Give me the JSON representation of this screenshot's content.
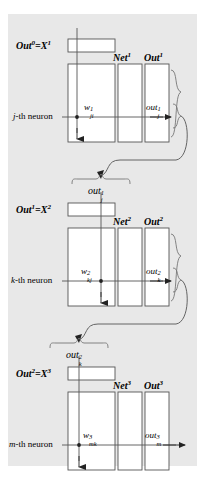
{
  "figure": {
    "background_color": "#e8e8e8",
    "line_color": "#555555",
    "text_color": "#000000"
  },
  "blocks": [
    {
      "id": "layer-1",
      "input_row_label": {
        "base": "Out",
        "sup1": "0",
        "eq": "=",
        "base2": "X",
        "sup2": "1"
      },
      "neuron_label": {
        "index": "j",
        "text": "-th neuron"
      },
      "column_headers": [
        {
          "base": "Net",
          "sup": "1"
        },
        {
          "base": "Out",
          "sup": "1"
        }
      ],
      "weight_symbol": {
        "base": "w",
        "sup": "1",
        "sub": "ji"
      },
      "output_symbol": {
        "base": "out",
        "sup": "1",
        "sub": "j"
      },
      "feedback_label": {
        "base": "out",
        "sup": "1",
        "sub": "j"
      },
      "has_feedback_loop": true
    },
    {
      "id": "layer-2",
      "input_row_label": {
        "base": "Out",
        "sup1": "1",
        "eq": "=",
        "base2": "X",
        "sup2": "2"
      },
      "neuron_label": {
        "index": "k",
        "text": "-th neuron"
      },
      "column_headers": [
        {
          "base": "Net",
          "sup": "2"
        },
        {
          "base": "Out",
          "sup": "2"
        }
      ],
      "weight_symbol": {
        "base": "w",
        "sup": "2",
        "sub": "kj"
      },
      "output_symbol": {
        "base": "out",
        "sup": "2",
        "sub": "k"
      },
      "feedback_label": {
        "base": "out",
        "sup": "2",
        "sub": "k"
      },
      "has_feedback_loop": true
    },
    {
      "id": "layer-3",
      "input_row_label": {
        "base": "Out",
        "sup1": "2",
        "eq": "=",
        "base2": "X",
        "sup2": "3"
      },
      "neuron_label": {
        "index": "m",
        "text": "-th neuron"
      },
      "column_headers": [
        {
          "base": "Net",
          "sup": "3"
        },
        {
          "base": "Out",
          "sup": "3"
        }
      ],
      "weight_symbol": {
        "base": "w",
        "sup": "3",
        "sub": "mk"
      },
      "output_symbol": {
        "base": "out",
        "sup": "3",
        "sub": "m"
      },
      "feedback_label": null,
      "has_feedback_loop": false
    }
  ]
}
